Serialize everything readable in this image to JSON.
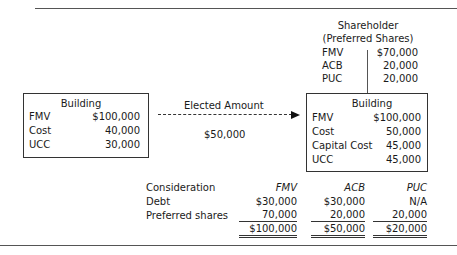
{
  "shareholder": {
    "title": "Shareholder",
    "subtitle": "(Preferred Shares)",
    "rows": [
      {
        "label": "FMV",
        "value": "$70,000"
      },
      {
        "label": "ACB",
        "value": "20,000"
      },
      {
        "label": "PUC",
        "value": "20,000"
      }
    ]
  },
  "left_box": {
    "title": "Building",
    "rows": [
      {
        "label": "FMV",
        "value": "$100,000"
      },
      {
        "label": "Cost",
        "value": "40,000"
      },
      {
        "label": "UCC",
        "value": "30,000"
      }
    ]
  },
  "transfer": {
    "label": "Elected Amount",
    "amount": "$50,000"
  },
  "right_box": {
    "title": "Building",
    "rows": [
      {
        "label": "FMV",
        "value": "$100,000"
      },
      {
        "label": "Cost",
        "value": "50,000"
      },
      {
        "label": "Capital Cost",
        "value": "45,000"
      },
      {
        "label": "UCC",
        "value": "45,000"
      }
    ]
  },
  "consideration": {
    "header": {
      "label": "Consideration",
      "cols": [
        "FMV",
        "ACB",
        "PUC"
      ]
    },
    "rows": [
      {
        "label": "Debt",
        "cols": [
          "$30,000",
          "$30,000",
          "N/A"
        ]
      },
      {
        "label": "Preferred shares",
        "cols": [
          "70,000",
          "20,000",
          "20,000"
        ]
      }
    ],
    "totals": [
      "$100,000",
      "$50,000",
      "$20,000"
    ]
  }
}
